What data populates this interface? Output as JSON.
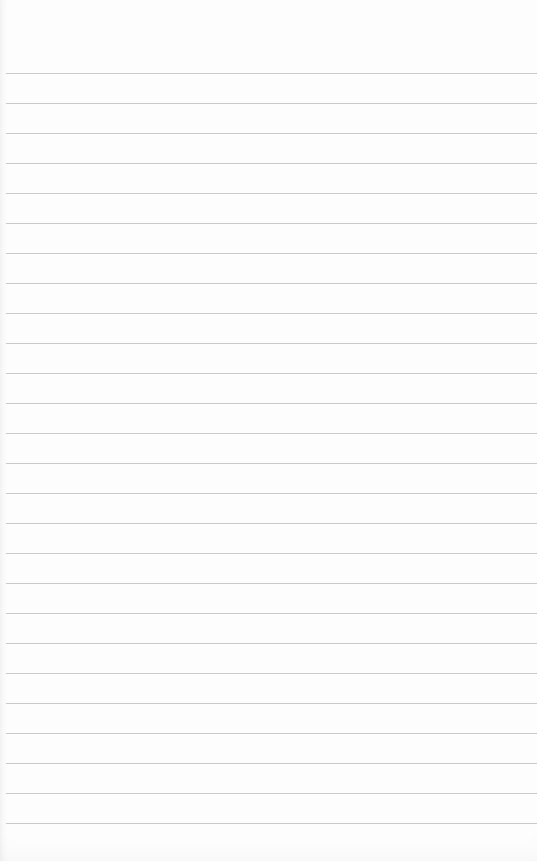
{
  "paper": {
    "type": "lined-paper",
    "background_color": "#fdfdfd",
    "line_color": "#c9c9c9",
    "first_line_y": 73,
    "line_spacing": 30,
    "line_count": 26
  }
}
